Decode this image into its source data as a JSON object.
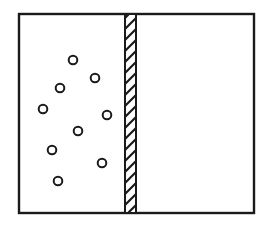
{
  "diagram": {
    "colors": {
      "stroke": "#1a1a1a",
      "background": "#ffffff"
    },
    "container": {
      "x": 19,
      "y": 14,
      "width": 235,
      "height": 199
    },
    "partition": {
      "x": 125,
      "width": 11,
      "pattern": "diagonal-hatch"
    },
    "left_chamber": {
      "particles": [
        {
          "cx": 73,
          "cy": 60
        },
        {
          "cx": 95,
          "cy": 78
        },
        {
          "cx": 60,
          "cy": 88
        },
        {
          "cx": 43,
          "cy": 109
        },
        {
          "cx": 107,
          "cy": 115
        },
        {
          "cx": 78,
          "cy": 131
        },
        {
          "cx": 52,
          "cy": 150
        },
        {
          "cx": 102,
          "cy": 163
        },
        {
          "cx": 58,
          "cy": 181
        }
      ],
      "particle_radius": 4.3
    },
    "right_chamber": {
      "particles": []
    }
  }
}
